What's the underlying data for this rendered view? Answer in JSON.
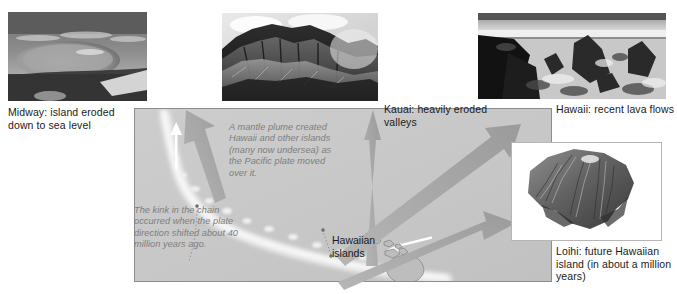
{
  "figure": {
    "colors": {
      "map_background": "#c9c9c9",
      "map_border": "#8d8d8d",
      "arrow_gray": "#a8a8a8",
      "arrow_white": "#ffffff",
      "note_text": "#7d7d7d",
      "caption_text": "#1a1a1a",
      "page_background": "#ffffff"
    }
  },
  "photos": [
    {
      "id": "midway",
      "alt": "aerial view of Midway atoll reef ring at sea level"
    },
    {
      "id": "kauai",
      "alt": "steep eroded ridges and valleys of Kauai"
    },
    {
      "id": "hawaii",
      "alt": "rough recent lava flow field on Hawaii"
    },
    {
      "id": "loihi",
      "alt": "shaded relief of the Loihi undersea seamount"
    }
  ],
  "captions": {
    "midway": "Midway: island eroded down to sea level",
    "kauai": "Kauai: heavily eroded valleys",
    "hawaii": "Hawaii: recent lava flows",
    "loihi": "Loihi: future Hawaiian island (in about a million years)"
  },
  "map": {
    "islands_label": "Hawaiian islands",
    "notes": {
      "plume": "A mantle plume created Hawaii and other islands (many now undersea) as the Pacific plate moved over it.",
      "kink": "The kink in the chain occurred when the plate direction shifted about 40 million years ago."
    }
  }
}
